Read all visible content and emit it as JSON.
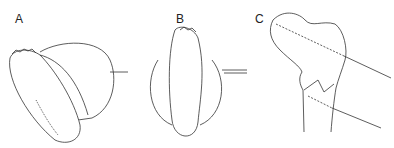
{
  "figure": {
    "panels": [
      {
        "label": "A",
        "description": "Foot sole viewed obliquely with rounded overlay and pointer line"
      },
      {
        "label": "B",
        "description": "Foot sole viewed from below with rounded overlay and double-line pointer"
      },
      {
        "label": "C",
        "description": "Proximal femur outline with fracture and two dashed screw trajectories"
      }
    ],
    "colors": {
      "line": "#333333",
      "background": "#ffffff"
    }
  }
}
